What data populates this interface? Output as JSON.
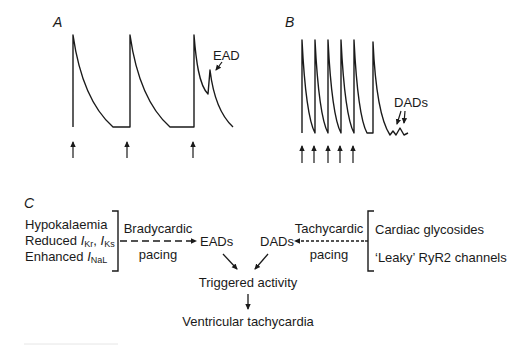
{
  "panels": {
    "a": {
      "label": "A",
      "annotation": "EAD",
      "pacing_arrow_count": 3,
      "description": "Bradycardic paced action potentials; third beat shows an early afterdepolarization"
    },
    "b": {
      "label": "B",
      "annotation": "DADs",
      "pacing_arrow_count": 5,
      "description": "Rapidly paced action potentials followed by delayed afterdepolarizations"
    },
    "c": {
      "label": "C",
      "left_causes": {
        "line1": "Hypokalaemia",
        "line2_prefix": "Reduced ",
        "line2_i1": "I",
        "line2_sub1": "Kr",
        "line2_sep": ", ",
        "line2_i2": "I",
        "line2_sub2": "Ks",
        "line3_prefix": "Enhanced ",
        "line3_i": "I",
        "line3_sub": "NaL"
      },
      "left_pacing": {
        "line1": "Bradycardic",
        "line2": "pacing"
      },
      "eads": "EADs",
      "dads": "DADs",
      "right_pacing": {
        "line1": "Tachycardic",
        "line2": "pacing"
      },
      "right_causes": {
        "line1": "Cardiac glycosides",
        "line2": "‘Leaky’ RyR2 channels"
      },
      "triggered": "Triggered activity",
      "outcome": "Ventricular tachycardia"
    }
  },
  "colors": {
    "ink": "#1a1a1a",
    "background": "#ffffff"
  }
}
